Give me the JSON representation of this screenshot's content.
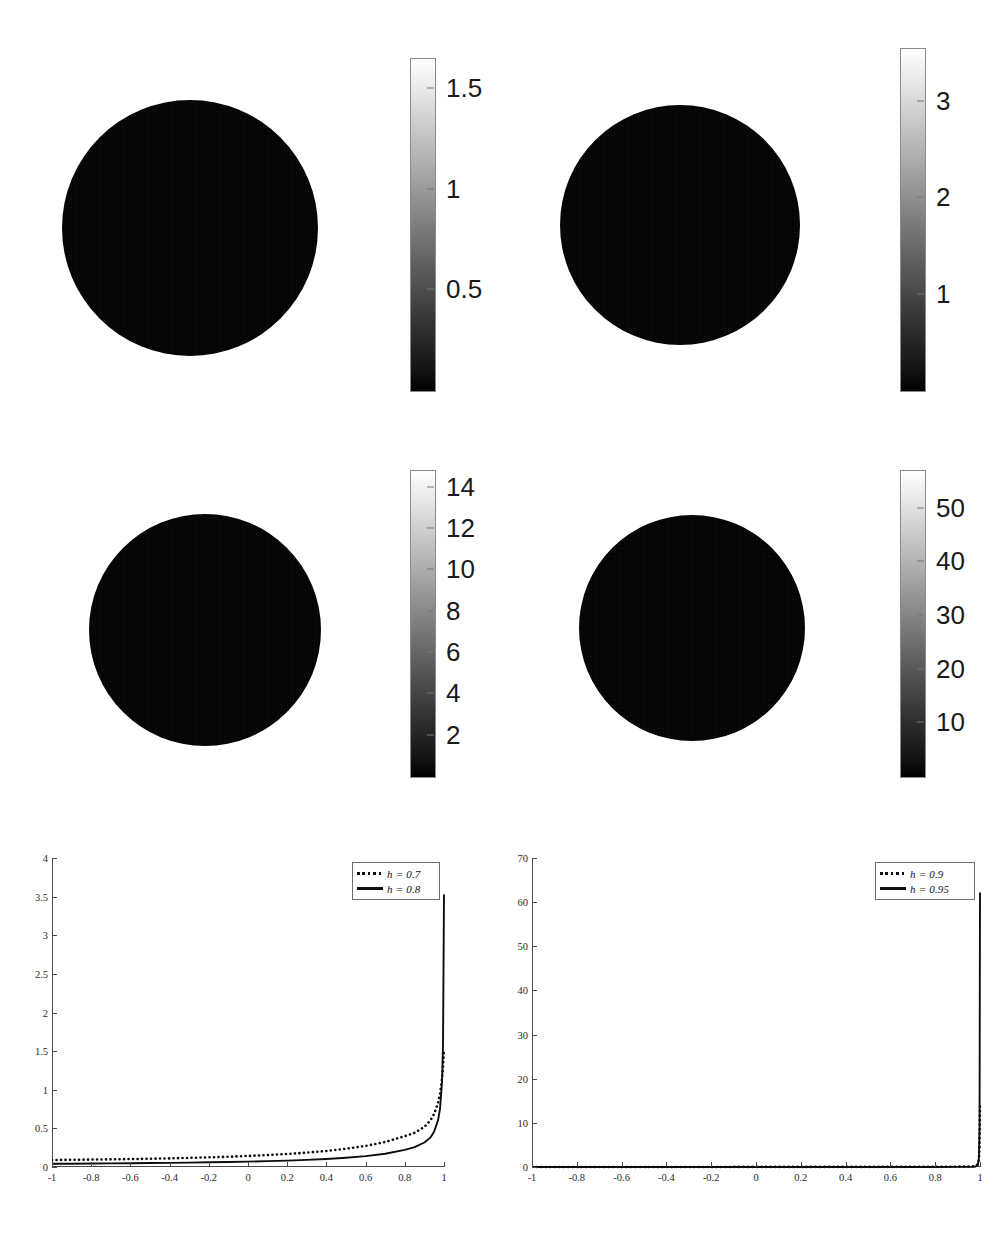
{
  "figure": {
    "title": "",
    "background": "#ffffff",
    "panel_count": 6
  },
  "colors": {
    "ink": "#1a1a1a",
    "axis": "#4a4a4a",
    "curve_solid": "#0d0d0d",
    "curve_dotted": "#0d0d0d",
    "sphere_dark": "#050505",
    "sphere_bright": "#ffffff",
    "colorbar_low": "#000000",
    "colorbar_high": "#ffffff"
  },
  "panels": [
    {
      "id": "sphere-a",
      "name": "poisson-kernel-sphere-h-0-7",
      "h_value": "0.7",
      "sphere": {
        "cx": 190,
        "cy": 228,
        "r": 128
      },
      "hotspot": {
        "cx": 220,
        "cy": 172,
        "r": 74,
        "peak": 1.5
      },
      "colorbar": {
        "x": 410,
        "y": 58,
        "w": 24,
        "h": 332,
        "vmin": 0,
        "vmax": 1.65,
        "ticks": [
          {
            "value": 1.5,
            "label": "1.5"
          },
          {
            "value": 1,
            "label": "1"
          },
          {
            "value": 0.5,
            "label": "0.5"
          }
        ],
        "tick_font_px": 26
      }
    },
    {
      "id": "sphere-b",
      "name": "poisson-kernel-sphere-h-0-8",
      "h_value": "0.8",
      "sphere": {
        "cx": 680,
        "cy": 225,
        "r": 120
      },
      "hotspot": {
        "cx": 706,
        "cy": 161,
        "r": 56,
        "peak": 3.5
      },
      "colorbar": {
        "x": 900,
        "y": 48,
        "w": 24,
        "h": 342,
        "vmin": 0,
        "vmax": 3.55,
        "ticks": [
          {
            "value": 3,
            "label": "3"
          },
          {
            "value": 2,
            "label": "2"
          },
          {
            "value": 1,
            "label": "1"
          }
        ],
        "tick_font_px": 26
      }
    },
    {
      "id": "sphere-c",
      "name": "poisson-kernel-sphere-h-0-9",
      "h_value": "0.9",
      "sphere": {
        "cx": 205,
        "cy": 630,
        "r": 116
      },
      "hotspot": {
        "cx": 226,
        "cy": 566,
        "r": 29,
        "peak": 14
      },
      "colorbar": {
        "x": 410,
        "y": 470,
        "w": 24,
        "h": 306,
        "vmin": 0,
        "vmax": 14.8,
        "ticks": [
          {
            "value": 14,
            "label": "14"
          },
          {
            "value": 12,
            "label": "12"
          },
          {
            "value": 10,
            "label": "10"
          },
          {
            "value": 8,
            "label": "8"
          },
          {
            "value": 6,
            "label": "6"
          },
          {
            "value": 4,
            "label": "4"
          },
          {
            "value": 2,
            "label": "2"
          }
        ],
        "tick_font_px": 26
      }
    },
    {
      "id": "sphere-d",
      "name": "poisson-kernel-sphere-h-0-95",
      "h_value": "0.95",
      "sphere": {
        "cx": 692,
        "cy": 628,
        "r": 113
      },
      "hotspot": {
        "cx": 702,
        "cy": 563,
        "r": 17,
        "peak": 55
      },
      "colorbar": {
        "x": 900,
        "y": 470,
        "w": 24,
        "h": 306,
        "vmin": 0,
        "vmax": 57,
        "ticks": [
          {
            "value": 50,
            "label": "50"
          },
          {
            "value": 40,
            "label": "40"
          },
          {
            "value": 30,
            "label": "30"
          },
          {
            "value": 20,
            "label": "20"
          },
          {
            "value": 10,
            "label": "10"
          }
        ],
        "tick_font_px": 26
      }
    }
  ],
  "chart_data": [
    {
      "id": "lineplot-left",
      "name": "kernel-profile-left",
      "type": "line",
      "title": "",
      "xlabel": "",
      "ylabel": "",
      "xlim": [
        -1,
        1
      ],
      "ylim": [
        0,
        4
      ],
      "grid": false,
      "legend_position": "top-right",
      "xticks": [
        -1,
        -0.8,
        -0.6,
        -0.4,
        -0.2,
        0,
        0.2,
        0.4,
        0.6,
        0.8,
        1
      ],
      "xticklabels": [
        "-1",
        "-0.8",
        "-0.6",
        "-0.4",
        "-0.2",
        "0",
        "0.2",
        "0.4",
        "0.6",
        "0.8",
        "1"
      ],
      "yticks": [
        0,
        0.5,
        1,
        1.5,
        2,
        2.5,
        3,
        3.5,
        4
      ],
      "yticklabels": [
        "0",
        "0.5",
        "1",
        "1.5",
        "2",
        "2.5",
        "3",
        "3.5",
        "4"
      ],
      "series": [
        {
          "name": "h = 0.7",
          "style": "dotted",
          "h": 0.7,
          "x": [
            -1,
            -0.9,
            -0.8,
            -0.7,
            -0.6,
            -0.5,
            -0.4,
            -0.3,
            -0.2,
            -0.1,
            0,
            0.1,
            0.2,
            0.3,
            0.4,
            0.5,
            0.6,
            0.7,
            0.8,
            0.85,
            0.9,
            0.93,
            0.95,
            0.97,
            0.98,
            0.99,
            0.995,
            1
          ],
          "values": [
            0.091,
            0.093,
            0.096,
            0.099,
            0.103,
            0.107,
            0.112,
            0.118,
            0.125,
            0.133,
            0.143,
            0.155,
            0.169,
            0.186,
            0.208,
            0.236,
            0.273,
            0.324,
            0.4,
            0.442,
            0.519,
            0.6,
            0.69,
            0.83,
            0.95,
            1.15,
            1.3,
            1.51
          ]
        },
        {
          "name": "h = 0.8",
          "style": "solid",
          "h": 0.8,
          "x": [
            -1,
            -0.9,
            -0.8,
            -0.7,
            -0.6,
            -0.5,
            -0.4,
            -0.3,
            -0.2,
            -0.1,
            0,
            0.1,
            0.2,
            0.3,
            0.4,
            0.5,
            0.6,
            0.7,
            0.8,
            0.85,
            0.9,
            0.93,
            0.95,
            0.97,
            0.98,
            0.99,
            0.995,
            1
          ],
          "values": [
            0.042,
            0.043,
            0.045,
            0.047,
            0.049,
            0.051,
            0.054,
            0.057,
            0.061,
            0.065,
            0.07,
            0.076,
            0.083,
            0.092,
            0.104,
            0.12,
            0.141,
            0.172,
            0.222,
            0.258,
            0.317,
            0.38,
            0.46,
            0.61,
            0.76,
            1.1,
            1.6,
            3.52
          ]
        }
      ]
    },
    {
      "id": "lineplot-right",
      "name": "kernel-profile-right",
      "type": "line",
      "title": "",
      "xlabel": "",
      "ylabel": "",
      "xlim": [
        -1,
        1
      ],
      "ylim": [
        0,
        70
      ],
      "grid": false,
      "legend_position": "top-right",
      "xticks": [
        -1,
        -0.8,
        -0.6,
        -0.4,
        -0.2,
        0,
        0.2,
        0.4,
        0.6,
        0.8,
        1
      ],
      "xticklabels": [
        "-1",
        "-0.8",
        "-0.6",
        "-0.4",
        "-0.2",
        "0",
        "0.2",
        "0.4",
        "0.6",
        "0.8",
        "1"
      ],
      "yticks": [
        0,
        10,
        20,
        30,
        40,
        50,
        60,
        70
      ],
      "yticklabels": [
        "0",
        "10",
        "20",
        "30",
        "40",
        "50",
        "60",
        "70"
      ],
      "series": [
        {
          "name": "h = 0.9",
          "style": "dotted",
          "h": 0.9,
          "x": [
            -1,
            -0.8,
            -0.6,
            -0.4,
            -0.2,
            0,
            0.2,
            0.4,
            0.6,
            0.8,
            0.9,
            0.95,
            0.97,
            0.98,
            0.99,
            0.995,
            0.998,
            1
          ],
          "values": [
            0.0105,
            0.0113,
            0.0124,
            0.0137,
            0.0155,
            0.0177,
            0.0209,
            0.0255,
            0.033,
            0.048,
            0.068,
            0.11,
            0.17,
            0.26,
            0.6,
            1.6,
            4.5,
            14.0
          ]
        },
        {
          "name": "h = 0.95",
          "style": "solid",
          "h": 0.95,
          "x": [
            -1,
            -0.8,
            -0.6,
            -0.4,
            -0.2,
            0,
            0.2,
            0.4,
            0.6,
            0.8,
            0.9,
            0.95,
            0.97,
            0.98,
            0.99,
            0.995,
            0.998,
            1
          ],
          "values": [
            0.00256,
            0.00275,
            0.003,
            0.00332,
            0.00374,
            0.0043,
            0.00508,
            0.00625,
            0.0082,
            0.0124,
            0.019,
            0.034,
            0.06,
            0.11,
            0.42,
            1.9,
            9.0,
            62.0
          ]
        }
      ]
    }
  ],
  "legends": [
    {
      "id": "legend-left",
      "name": "legend-left-plot",
      "entries": [
        {
          "style": "dotted",
          "label": "h = 0.7"
        },
        {
          "style": "solid",
          "label": "h = 0.8"
        }
      ]
    },
    {
      "id": "legend-right",
      "name": "legend-right-plot",
      "entries": [
        {
          "style": "dotted",
          "label": "h = 0.9"
        },
        {
          "style": "solid",
          "label": "h = 0.95"
        }
      ]
    }
  ]
}
